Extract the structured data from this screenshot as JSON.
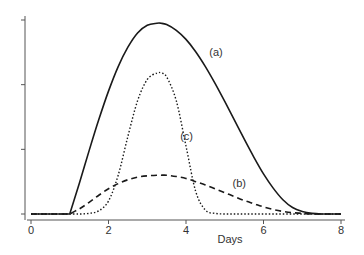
{
  "chart_data": {
    "type": "line",
    "title": "",
    "xlabel": "Days",
    "ylabel": "",
    "xlim": [
      0,
      8
    ],
    "ylim": [
      0,
      3
    ],
    "xticks": [
      0,
      2,
      4,
      6,
      8
    ],
    "xtick_labels": [
      "0",
      "2",
      "4",
      "6",
      "8"
    ],
    "yticks": [
      0,
      1,
      2,
      3
    ],
    "ytick_labels": [
      "",
      "",
      "",
      ""
    ],
    "grid": false,
    "legend": "none",
    "x": [
      0,
      1,
      1.25,
      1.5,
      1.75,
      2,
      2.25,
      2.5,
      2.75,
      3,
      3.25,
      3.35,
      3.5,
      3.75,
      4,
      4.25,
      4.5,
      4.75,
      5,
      5.25,
      5.5,
      5.75,
      6,
      6.25,
      6.5,
      6.75,
      7,
      7.25,
      7.5,
      7.75,
      8
    ],
    "series": [
      {
        "name": "(a)",
        "style": "solid",
        "values": [
          0,
          0,
          0.48,
          0.98,
          1.46,
          1.9,
          2.28,
          2.58,
          2.8,
          2.92,
          2.95,
          2.95,
          2.93,
          2.84,
          2.7,
          2.51,
          2.28,
          2.02,
          1.74,
          1.45,
          1.16,
          0.88,
          0.62,
          0.4,
          0.22,
          0.1,
          0.04,
          0.01,
          0,
          0,
          0
        ]
      },
      {
        "name": "(b)",
        "style": "dashed",
        "values": [
          0,
          0,
          0.08,
          0.18,
          0.29,
          0.39,
          0.47,
          0.53,
          0.57,
          0.59,
          0.6,
          0.6,
          0.6,
          0.58,
          0.55,
          0.5,
          0.45,
          0.39,
          0.33,
          0.27,
          0.21,
          0.16,
          0.11,
          0.07,
          0.04,
          0.02,
          0.01,
          0,
          0,
          0,
          0
        ]
      },
      {
        "name": "(c)",
        "style": "dotted",
        "values": [
          0,
          0,
          0,
          0.01,
          0.05,
          0.2,
          0.6,
          1.2,
          1.75,
          2.08,
          2.18,
          2.18,
          2.12,
          1.75,
          1.05,
          0.35,
          0.06,
          0.01,
          0,
          0,
          0,
          0,
          0,
          0,
          0,
          0,
          0,
          0,
          0,
          0,
          0
        ]
      }
    ],
    "annotations": [
      {
        "text": "(a)",
        "x": 4.6,
        "y": 2.45
      },
      {
        "text": "(b)",
        "x": 5.2,
        "y": 0.42
      },
      {
        "text": "(c)",
        "x": 3.85,
        "y": 1.15
      }
    ]
  }
}
